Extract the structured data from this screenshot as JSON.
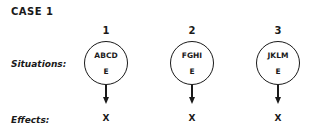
{
  "title": "CASE 1",
  "labels": {
    "situations": "Situations:",
    "effects": "Effects:"
  },
  "cases": [
    {
      "number": "1",
      "situation": "ABCD",
      "inner": "E",
      "effect": "X"
    },
    {
      "number": "2",
      "situation": "FGHI",
      "inner": "E",
      "effect": "X"
    },
    {
      "number": "3",
      "situation": "JKLM",
      "inner": "E",
      "effect": "X"
    }
  ]
}
